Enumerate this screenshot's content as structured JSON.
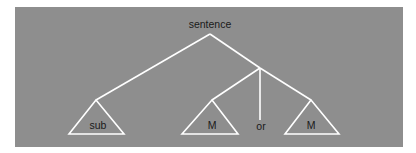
{
  "diagram": {
    "type": "parse-tree",
    "root": {
      "label": "sentence"
    },
    "leaves": [
      {
        "label": "sub",
        "kind": "triangle"
      },
      {
        "label": "M",
        "kind": "triangle"
      },
      {
        "label": "or",
        "kind": "terminal"
      },
      {
        "label": "M",
        "kind": "triangle"
      }
    ],
    "colors": {
      "panel": "#8e8e8e",
      "lines": "#ffffff",
      "text": "#1a1a1a"
    }
  }
}
